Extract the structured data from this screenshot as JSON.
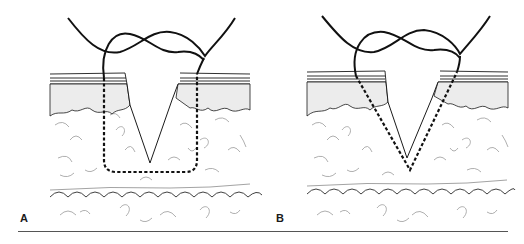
{
  "figure": {
    "panels": [
      {
        "id": "A",
        "label": "A",
        "suture_path": "rectangular box (vertical mattress-like, square-bottomed) below wound"
      },
      {
        "id": "B",
        "label": "B",
        "suture_path": "triangular V path converging below wound apex"
      }
    ],
    "colors": {
      "ink": "#1a1a1a",
      "tissue_sketch": "#9a9a9a",
      "stipple": "#777777",
      "rule": "#555555",
      "background": "#ffffff"
    }
  }
}
